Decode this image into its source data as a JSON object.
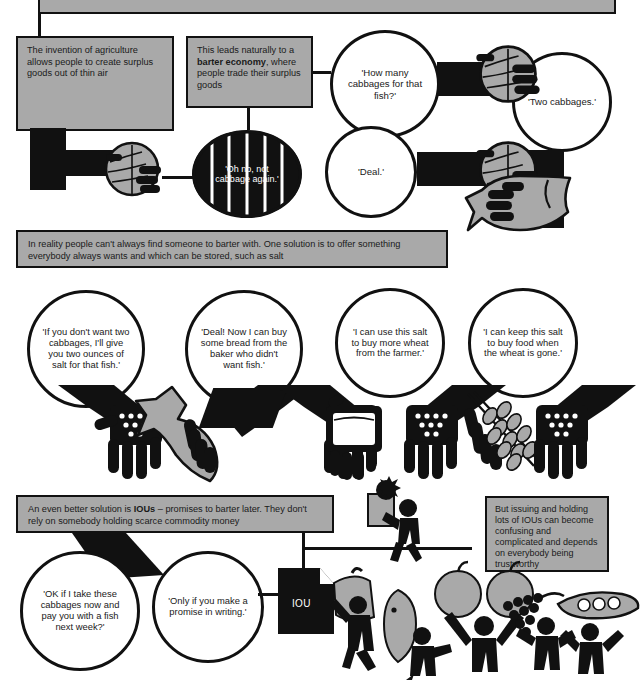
{
  "page": {
    "bg_color": "#ffffff",
    "ink_color": "#111111",
    "panel_fill": "#a9a9a9"
  },
  "top_banner": {
    "note": "cut-off grey banner at very top edge",
    "text": ""
  },
  "panels": [
    {
      "id": "agriculture",
      "text": "The invention of agriculture allows people to create surplus goods out of thin air"
    },
    {
      "id": "barter-economy",
      "text_before": "This leads naturally to a ",
      "text_bold": "barter economy",
      "text_after": ", where people trade their surplus goods"
    },
    {
      "id": "salt-banner",
      "text": "In reality people can't always find someone to barter with. One solution is to offer something everybody always wants and which can be stored, such as salt"
    },
    {
      "id": "iou-banner",
      "text_before": "An even better solution is ",
      "text_bold": "IOUs",
      "text_after": " – promises to barter later. They don't rely on somebody holding scarce commodity money"
    },
    {
      "id": "iou-warning",
      "text": "But issuing and holding lots of IOUs can become confusing and complicated and depends on everybody being trustworthy"
    }
  ],
  "bubbles": {
    "barter_row": [
      {
        "id": "how-many-cabbages",
        "text": "'How many cabbages for that fish?'",
        "style": "light"
      },
      {
        "id": "two-cabbages",
        "text": "'Two cabbages.'",
        "style": "light"
      },
      {
        "id": "oh-no-cabbage",
        "text": "'Oh no, not cabbage again.'",
        "style": "dark"
      },
      {
        "id": "deal",
        "text": "'Deal.'",
        "style": "light"
      }
    ],
    "salt_row": [
      {
        "id": "two-ounces-salt",
        "text": "'If you don't want two cabbages, I'll give you two ounces of salt for that fish.'"
      },
      {
        "id": "deal-bread",
        "text": "'Deal! Now I can buy some bread from the baker who didn't want fish.'"
      },
      {
        "id": "buy-wheat",
        "text": "'I can use this salt to buy more wheat from the farmer.'"
      },
      {
        "id": "keep-salt",
        "text": "'I can keep this salt to buy food when the wheat is gone.'"
      }
    ],
    "iou_row": [
      {
        "id": "take-cabbages-now",
        "text": "'OK if I take these cabbages now and pay you with a fish next week?'"
      },
      {
        "id": "promise-writing",
        "text": "'Only if you make a promise in writing.'"
      }
    ]
  },
  "icons": {
    "iou_document_label": "IOU",
    "names": [
      "cabbage-icon",
      "fish-icon",
      "salt-grains-icon",
      "bread-loaf-icon",
      "wheat-sheaf-icon",
      "apple-icon",
      "grapes-icon",
      "peapod-icon",
      "sack-icon",
      "hand-icon",
      "iou-document-icon",
      "person-icon"
    ]
  }
}
